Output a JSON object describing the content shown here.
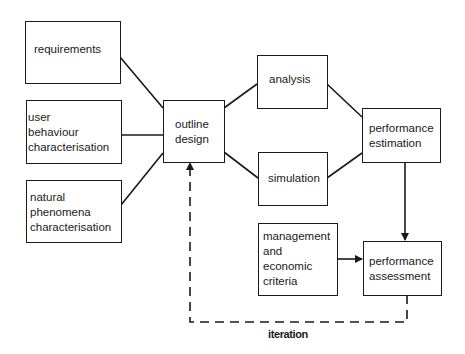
{
  "diagram": {
    "type": "flowchart",
    "nodes": [
      {
        "id": "requirements",
        "lines": [
          "requirements"
        ]
      },
      {
        "id": "user_behaviour",
        "lines": [
          "user",
          "behaviour",
          "characterisation"
        ]
      },
      {
        "id": "natural_phenomena",
        "lines": [
          "natural",
          "phenomena",
          "characterisation"
        ]
      },
      {
        "id": "outline_design",
        "lines": [
          "outline",
          "design"
        ]
      },
      {
        "id": "analysis",
        "lines": [
          "analysis"
        ]
      },
      {
        "id": "simulation",
        "lines": [
          "simulation"
        ]
      },
      {
        "id": "performance_estimation",
        "lines": [
          "performance",
          "estimation"
        ]
      },
      {
        "id": "management",
        "lines": [
          "management",
          "and",
          "economic",
          "criteria"
        ]
      },
      {
        "id": "performance_assessment",
        "lines": [
          "performance",
          "assessment"
        ]
      }
    ],
    "edges": [
      {
        "from": "requirements",
        "to": "outline_design",
        "style": "solid"
      },
      {
        "from": "user_behaviour",
        "to": "outline_design",
        "style": "solid"
      },
      {
        "from": "natural_phenomena",
        "to": "outline_design",
        "style": "solid"
      },
      {
        "from": "outline_design",
        "to": "analysis",
        "style": "solid"
      },
      {
        "from": "outline_design",
        "to": "simulation",
        "style": "solid"
      },
      {
        "from": "analysis",
        "to": "performance_estimation",
        "style": "solid"
      },
      {
        "from": "simulation",
        "to": "performance_estimation",
        "style": "solid"
      },
      {
        "from": "performance_estimation",
        "to": "performance_assessment",
        "style": "solid-arrow"
      },
      {
        "from": "management",
        "to": "performance_assessment",
        "style": "solid-arrow"
      },
      {
        "from": "performance_assessment",
        "to": "outline_design",
        "style": "dashed-arrow",
        "label": "iteration"
      }
    ],
    "iteration_label": "iteration"
  }
}
